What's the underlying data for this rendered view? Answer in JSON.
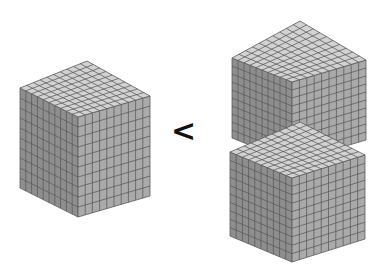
{
  "figure": {
    "comparison_symbol": "<",
    "left_group": {
      "cube_count": 1,
      "units_per_edge": 10,
      "label": "one thousand-cube"
    },
    "right_group": {
      "cube_count": 2,
      "units_per_edge": 10,
      "label": "two stacked thousand-cubes"
    }
  },
  "colors": {
    "background": "#ffffff",
    "top_face": "#d2d2d2",
    "left_face": "#8e8e8e",
    "right_face": "#aaaaaa",
    "grid_line": "#5a5a5a",
    "symbol": "#111111"
  },
  "cubes": [
    {
      "id": "left",
      "top": [
        87,
        61
      ],
      "left_up": [
        20,
        88
      ],
      "front": [
        78,
        117
      ],
      "right_up": [
        150,
        96
      ],
      "height": 100
    },
    {
      "id": "right-upper",
      "top": [
        300,
        21
      ],
      "left_up": [
        232,
        58
      ],
      "front": [
        292,
        82
      ],
      "right_up": [
        366,
        60
      ],
      "height": 80
    },
    {
      "id": "right-lower",
      "top": [
        300,
        122
      ],
      "left_up": [
        230,
        152
      ],
      "front": [
        292,
        178
      ],
      "right_up": [
        365,
        155
      ],
      "height": 84
    }
  ]
}
